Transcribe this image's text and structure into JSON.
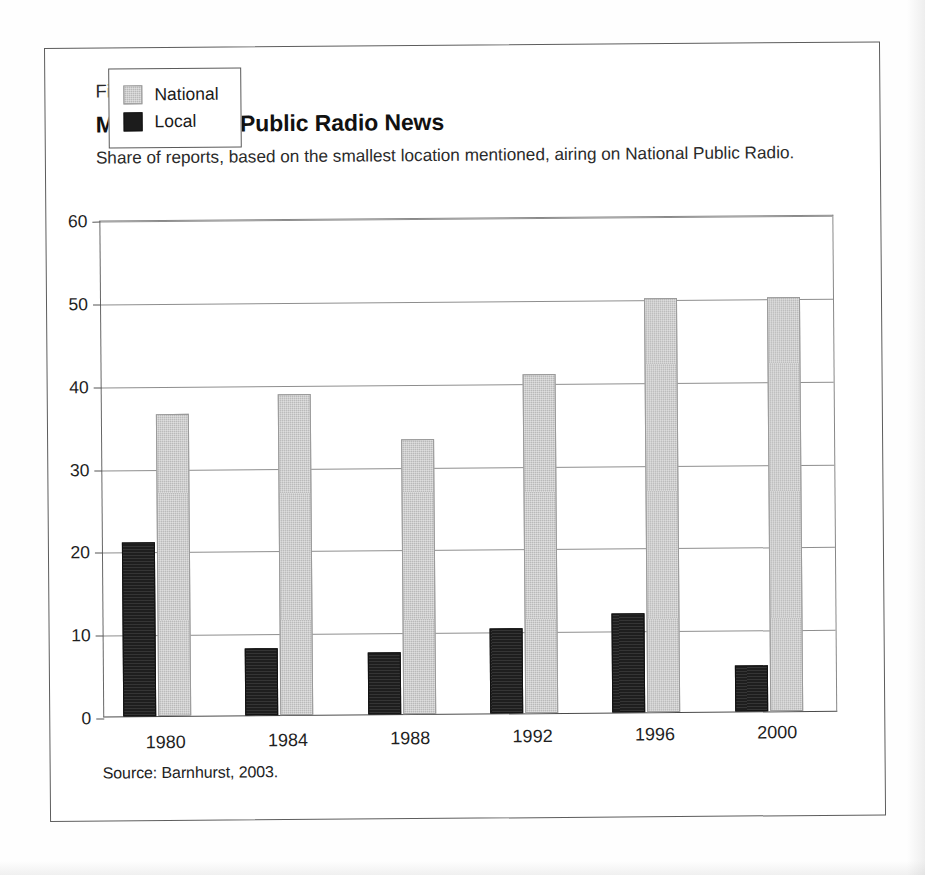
{
  "figure": {
    "number": "Figure 11.2",
    "title": "More Distant Public Radio News",
    "subtitle": "Share of reports, based on the smallest location mentioned, airing on National Public Radio.",
    "source": "Source: Barnhurst, 2003."
  },
  "legend": {
    "position": "inside-top-left",
    "entries": [
      {
        "label": "National",
        "color": "#b9b9b9"
      },
      {
        "label": "Local",
        "color": "#1c1c1c"
      }
    ]
  },
  "axis": {
    "y_ticks": [
      "60",
      "50",
      "40",
      "30",
      "20",
      "10",
      "0"
    ]
  },
  "chart_data": {
    "type": "bar",
    "title": "More Distant Public Radio News",
    "subtitle": "Share of reports, based on the smallest location mentioned, airing on National Public Radio.",
    "xlabel": "",
    "ylabel": "",
    "ylim": [
      0,
      60
    ],
    "ytick_values": [
      0,
      10,
      20,
      30,
      40,
      50,
      60
    ],
    "grid": true,
    "legend_position": "inside-top-left",
    "categories": [
      "1980",
      "1984",
      "1988",
      "1992",
      "1996",
      "2000"
    ],
    "series": [
      {
        "name": "National",
        "color": "#b9b9b9",
        "values": [
          36.5,
          38.8,
          33.2,
          40.9,
          50.0,
          50.0
        ]
      },
      {
        "name": "Local",
        "color": "#1c1c1c",
        "values": [
          21.0,
          8.1,
          7.5,
          10.3,
          11.9,
          5.5
        ]
      }
    ],
    "source": "Source: Barnhurst, 2003."
  }
}
